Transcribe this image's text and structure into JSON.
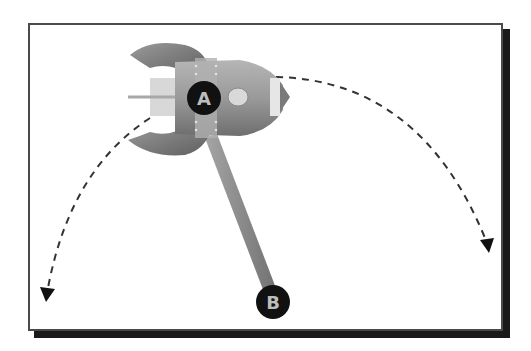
{
  "diagram": {
    "type": "pendulum-rocket-illustration",
    "points": [
      {
        "id": "A",
        "label": "A",
        "role": "pivot on rocket body"
      },
      {
        "id": "B",
        "label": "B",
        "role": "end of rod / bob"
      }
    ],
    "arrows": [
      {
        "id": "left-swing",
        "style": "dashed",
        "direction": "down-left"
      },
      {
        "id": "right-swing",
        "style": "dashed",
        "direction": "down-right"
      }
    ],
    "colors": {
      "frame_border": "#4a4a4a",
      "shadow": "#1a1a1a",
      "label_circle": "#111111",
      "label_text": "#bdbdbd",
      "rod": "#8c8c8c",
      "rocket_body": "#9a9a9a",
      "fins": "#7d7d7d",
      "dash": "#333333"
    }
  }
}
